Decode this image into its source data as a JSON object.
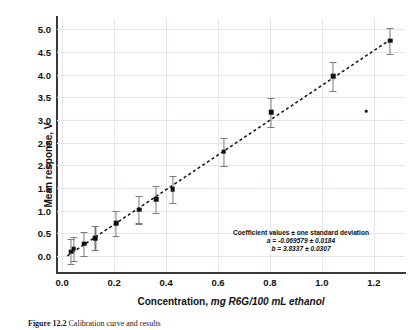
{
  "figure": {
    "caption_number": "Figure 12.2",
    "caption_text": "Calibration curve and results"
  },
  "annotation": {
    "header": "Coefficient values ± one standard deviation",
    "line_a": "a = -0.069579 ± 0.0184",
    "line_b": "b = 3.8337 ± 0.0307"
  },
  "chart_data": {
    "type": "scatter",
    "title": "",
    "xlabel": "Concentration, mg R6G/100 mL ethanol",
    "xlabel_plain": "Concentration,",
    "xlabel_italic": "mg R6G/100 mL ethanol",
    "ylabel": "Mean response, V",
    "xlim": [
      -0.02,
      1.32
    ],
    "ylim": [
      -0.35,
      5.25
    ],
    "xticks": [
      0.0,
      0.2,
      0.4,
      0.6,
      0.8,
      1.0,
      1.2
    ],
    "xticklabels": [
      "0.0",
      "0.2",
      "0.4",
      "0.6",
      "0.8",
      "1.0",
      "1.2"
    ],
    "yticks": [
      0.0,
      0.5,
      1.0,
      1.5,
      2.0,
      2.5,
      3.0,
      3.5,
      4.0,
      4.5,
      5.0
    ],
    "yticklabels": [
      "0.0",
      "0.5",
      "1.0",
      "1.5",
      "2.0",
      "2.5",
      "3.0",
      "3.5",
      "4.0",
      "4.5",
      "5.0"
    ],
    "grid": true,
    "legend": null,
    "marker_color": "#111111",
    "errorbar_color": "#7c7c7c",
    "fit": {
      "style": "dashed",
      "intercept": -0.069579,
      "intercept_err": 0.0184,
      "slope": 3.8337,
      "slope_err": 0.0307,
      "x_start": 0.02,
      "x_end": 1.27
    },
    "series": [
      {
        "name": "Mean response",
        "x": [
          0.035,
          0.045,
          0.085,
          0.128,
          0.208,
          0.297,
          0.362,
          0.425,
          0.622,
          0.805,
          1.043,
          1.262
        ],
        "y": [
          0.1,
          0.16,
          0.27,
          0.4,
          0.72,
          1.02,
          1.25,
          1.47,
          2.3,
          3.17,
          3.97,
          4.75
        ],
        "yerr": [
          0.27,
          0.27,
          0.27,
          0.27,
          0.28,
          0.3,
          0.29,
          0.3,
          0.31,
          0.32,
          0.32,
          0.29
        ]
      }
    ],
    "outliers": [
      {
        "x": 1.17,
        "y": 3.2
      }
    ]
  }
}
